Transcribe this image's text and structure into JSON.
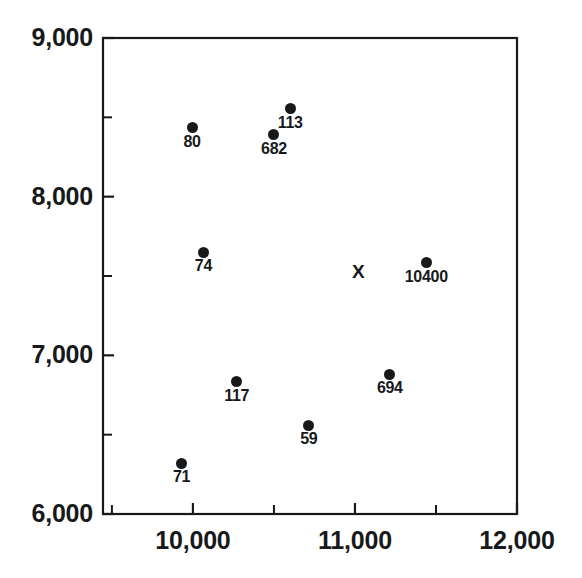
{
  "chart_data": {
    "type": "scatter",
    "title": "",
    "xlabel": "",
    "ylabel": "",
    "xlim": [
      9445,
      12000
    ],
    "ylim": [
      6000,
      9000
    ],
    "grid": false,
    "legend": null,
    "x_ticks": [
      10000,
      11000,
      12000
    ],
    "x_tick_labels": [
      "10,000",
      "11,000",
      "12,000"
    ],
    "x_minor_ticks": [
      9500,
      10500,
      11500
    ],
    "y_ticks": [
      6000,
      7000,
      8000,
      9000
    ],
    "y_tick_labels": [
      "6,000",
      "7,000",
      "8,000",
      "9,000"
    ],
    "y_minor_ticks": [
      6500,
      7500,
      8500
    ],
    "points": [
      {
        "label": "113",
        "x": 10600,
        "y": 8555,
        "marker": "circle"
      },
      {
        "label": "80",
        "x": 9995,
        "y": 8435,
        "marker": "circle"
      },
      {
        "label": "682",
        "x": 10500,
        "y": 8390,
        "marker": "circle"
      },
      {
        "label": "74",
        "x": 10065,
        "y": 7650,
        "marker": "circle"
      },
      {
        "label": "10400",
        "x": 11440,
        "y": 7585,
        "marker": "circle"
      },
      {
        "label": "",
        "x": 11025,
        "y": 7530,
        "marker": "x"
      },
      {
        "label": "694",
        "x": 11215,
        "y": 6880,
        "marker": "circle"
      },
      {
        "label": "117",
        "x": 10270,
        "y": 6835,
        "marker": "circle"
      },
      {
        "label": "59",
        "x": 10715,
        "y": 6560,
        "marker": "circle"
      },
      {
        "label": "71",
        "x": 9930,
        "y": 6320,
        "marker": "circle"
      }
    ],
    "colors": {
      "marker": "#17191a",
      "axis": "#17191a",
      "background": "#ffffff",
      "text": "#17191a"
    }
  },
  "axes": {
    "y_labels": [
      "9,000",
      "8,000",
      "7,000",
      "6,000"
    ],
    "x_labels": [
      "10,000",
      "11,000",
      "12,000"
    ]
  }
}
